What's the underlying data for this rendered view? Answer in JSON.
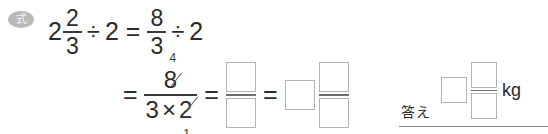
{
  "badge": {
    "label": "式",
    "name": "expression-badge",
    "color": "#b9b9b9"
  },
  "line1": {
    "whole": "2",
    "frac_num": "2",
    "frac_den": "3",
    "divide": "÷",
    "divisor": "2",
    "equals": "=",
    "rhs_num": "8",
    "rhs_den": "3",
    "rhs_divide": "÷",
    "rhs_divisor": "2"
  },
  "line2": {
    "equals_1": "=",
    "numerator": "8",
    "numerator_reduced": "4",
    "den_left": "3",
    "den_times": "×",
    "den_right": "2",
    "den_right_reduced": "1",
    "equals_2": "=",
    "equals_3": "="
  },
  "answer": {
    "label": "答え",
    "unit": "kg"
  },
  "placeholders": {
    "blank": ""
  },
  "colors": {
    "ink": "#2c2c2c",
    "box_border": "#b4b4b4",
    "rule": "#888888",
    "strike": "#6a6a6a"
  }
}
